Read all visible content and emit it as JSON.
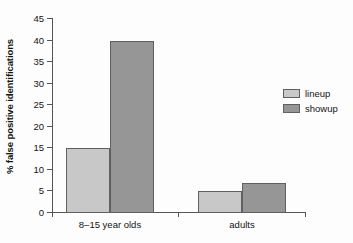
{
  "chart_data": {
    "type": "bar",
    "title": "",
    "subtitle": "",
    "xlabel": "",
    "ylabel": "% false positive identifications",
    "categories": [
      "8–15 year olds",
      "adults"
    ],
    "series": [
      {
        "name": "lineup",
        "values": [
          15,
          5
        ],
        "color": "#c8c8c8"
      },
      {
        "name": "showup",
        "values": [
          40,
          7
        ],
        "color": "#969696"
      }
    ],
    "ylim": [
      0,
      45
    ],
    "ytick_step": 5,
    "yticks": [
      0,
      5,
      10,
      15,
      20,
      25,
      30,
      35,
      40,
      45
    ],
    "ytick_labels": [
      "0",
      "5",
      "10",
      "15",
      "20",
      "25",
      "30",
      "35",
      "40",
      "45"
    ],
    "grid": false,
    "legend_position": "right",
    "legend_entries": [
      "lineup",
      "showup"
    ],
    "annotations": []
  },
  "axes": {
    "y_title": "% false positive identifications",
    "x_group_labels": [
      "8–15 year olds",
      "adults"
    ]
  },
  "legend": {
    "items": [
      {
        "label": "lineup"
      },
      {
        "label": "showup"
      }
    ]
  },
  "colors": {
    "lineup": "#c8c8c8",
    "showup": "#969696",
    "axis": "#555555",
    "bar_outline": "#606060",
    "text": "#141414",
    "background": "#fdfdfd"
  }
}
